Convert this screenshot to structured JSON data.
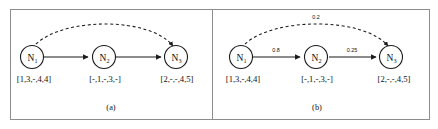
{
  "figure": {
    "panels": [
      {
        "id": "a",
        "caption": "(a)",
        "nodes": [
          {
            "id": "n1",
            "label": "N",
            "subscript": "1",
            "vector": "[1,3,-,4,4]"
          },
          {
            "id": "n2",
            "label": "N",
            "subscript": "2",
            "vector": "[-,1,-,3,-]"
          },
          {
            "id": "n3",
            "label": "N",
            "subscript": "3",
            "vector": "[2,-,-,4,5]"
          }
        ],
        "edges": [
          {
            "from": "n1",
            "to": "n2",
            "style": "solid",
            "weight": ""
          },
          {
            "from": "n2",
            "to": "n3",
            "style": "solid",
            "weight": ""
          },
          {
            "from": "n1",
            "to": "n3",
            "style": "dashed",
            "weight": ""
          }
        ]
      },
      {
        "id": "b",
        "caption": "(b)",
        "nodes": [
          {
            "id": "n1",
            "label": "N",
            "subscript": "1",
            "vector": "[1,3,-,4,4]"
          },
          {
            "id": "n2",
            "label": "N",
            "subscript": "2",
            "vector": "[-,1,-,3,-]"
          },
          {
            "id": "n3",
            "label": "N",
            "subscript": "3",
            "vector": "[2,-,-,4,5]"
          }
        ],
        "edges": [
          {
            "from": "n1",
            "to": "n2",
            "style": "solid",
            "weight": "0.8"
          },
          {
            "from": "n2",
            "to": "n3",
            "style": "solid",
            "weight": "0.25"
          },
          {
            "from": "n1",
            "to": "n3",
            "style": "dashed",
            "weight": "0.2"
          }
        ]
      }
    ],
    "colors": {
      "stroke": "#1a1a1a",
      "frame": "#8d8d8d",
      "background": "#ffffff",
      "text": "#111111"
    }
  }
}
